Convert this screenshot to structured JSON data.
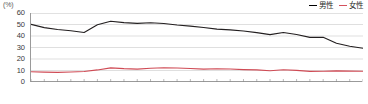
{
  "chart_data": {
    "type": "line",
    "title": "",
    "subtitle": "",
    "xlabel": "2017(年)",
    "ylabel": "(%)",
    "unit": "(%)",
    "grid": true,
    "legend_position": "top-right",
    "ylim": [
      0,
      60
    ],
    "yticks": [
      0,
      10,
      20,
      30,
      40,
      50,
      60
    ],
    "xlim": [
      1992,
      2017
    ],
    "x": [
      1992,
      1993,
      1994,
      1995,
      1996,
      1997,
      1998,
      1999,
      2000,
      2001,
      2002,
      2003,
      2004,
      2005,
      2006,
      2007,
      2008,
      2009,
      2010,
      2011,
      2012,
      2013,
      2014,
      2015,
      2016,
      2017
    ],
    "xticks_labeled": [
      "1992",
      "1995",
      "2000",
      "2005",
      "2010",
      "2015",
      "2017(年)"
    ],
    "series": [
      {
        "name": "男性",
        "color": "#231f20",
        "values": [
          50.1,
          47.3,
          45.6,
          44.6,
          43.1,
          49.8,
          52.8,
          51.6,
          51.0,
          51.5,
          50.9,
          49.6,
          48.6,
          47.4,
          46.0,
          45.3,
          44.3,
          42.9,
          41.2,
          43.1,
          41.3,
          38.8,
          38.9,
          33.7,
          31.1,
          29.4
        ]
      },
      {
        "name": "女性",
        "color": "#cf4b55",
        "values": [
          8.9,
          8.6,
          8.4,
          8.7,
          9.1,
          10.5,
          12.3,
          11.6,
          11.2,
          11.9,
          12.4,
          12.2,
          11.8,
          11.2,
          11.5,
          11.3,
          10.8,
          10.5,
          9.8,
          10.6,
          10.1,
          9.2,
          9.4,
          9.7,
          9.5,
          9.3
        ]
      }
    ],
    "annotations": []
  },
  "legend": {
    "items": [
      {
        "label": "男性",
        "color": "#231f20"
      },
      {
        "label": "女性",
        "color": "#cf4b55"
      }
    ]
  },
  "axis": {
    "unit_label": "(%)",
    "y_tick_labels": [
      "60",
      "50",
      "40",
      "30",
      "20",
      "10",
      "0"
    ],
    "x_tick_labels": [
      "1992",
      "1995",
      "2000",
      "2005",
      "2010",
      "2015",
      "2017(年)"
    ]
  }
}
